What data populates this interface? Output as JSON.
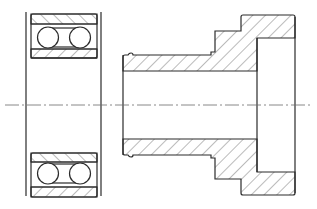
{
  "diagram": {
    "type": "mechanical-section-drawing",
    "canvas": {
      "width": 317,
      "height": 209,
      "background": "#ffffff"
    },
    "colors": {
      "line": "#2b2b2b",
      "hatch": "#555555",
      "centerline": "#6a6a6a"
    },
    "parts": [
      {
        "name": "double-row-ball-bearing",
        "position": "left",
        "balls_per_side": 2,
        "rows": 2
      },
      {
        "name": "stepped-flanged-sleeve",
        "position": "right",
        "sectioned": true
      }
    ],
    "centerline": {
      "y": 105,
      "x_start": 5,
      "x_end": 310,
      "style": "dash-dot"
    }
  }
}
